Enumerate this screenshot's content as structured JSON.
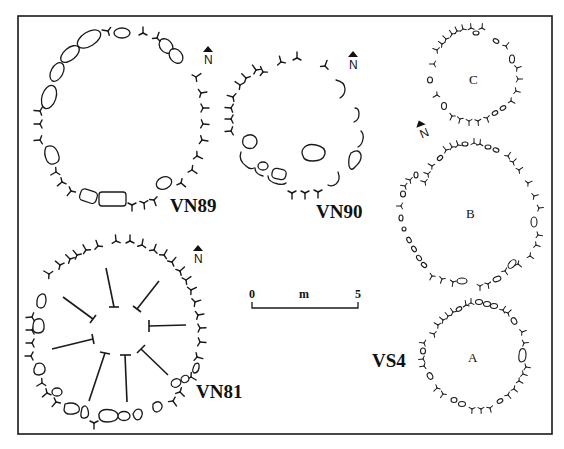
{
  "figure": {
    "type": "archaeological site plan",
    "frame": {
      "x": 18,
      "y": 16,
      "width": 534,
      "height": 418
    }
  },
  "sites": [
    {
      "id": "vn89",
      "label": "VN89",
      "center": [
        120,
        120
      ],
      "radius": 82,
      "label_pos": [
        170,
        212
      ]
    },
    {
      "id": "vn90",
      "label": "VN90",
      "center": [
        298,
        130
      ],
      "radius": 64,
      "label_pos": [
        316,
        218
      ]
    },
    {
      "id": "vn81",
      "label": "VN81",
      "center": [
        120,
        330
      ],
      "radius": 95,
      "label_pos": [
        196,
        398
      ]
    },
    {
      "id": "vs4",
      "label": "VS4",
      "label_pos": [
        372,
        367
      ]
    }
  ],
  "rings": [
    {
      "id": "ring-c",
      "letter": "C",
      "center": [
        473,
        70
      ],
      "radius": 43
    },
    {
      "id": "ring-b",
      "letter": "B",
      "center": [
        472,
        215
      ],
      "radius": 73
    },
    {
      "id": "ring-a",
      "letter": "A",
      "center": [
        472,
        360
      ],
      "radius": 50
    }
  ],
  "north_arrows": [
    {
      "id": "north-vn89",
      "letter": "N",
      "pos": [
        208,
        52
      ],
      "rotation": 0
    },
    {
      "id": "north-vn90",
      "letter": "N",
      "pos": [
        353,
        58
      ],
      "rotation": 0
    },
    {
      "id": "north-vs4",
      "letter": "N",
      "pos": [
        417,
        132
      ],
      "rotation": -20
    },
    {
      "id": "north-vn81",
      "letter": "N",
      "pos": [
        197,
        258
      ],
      "rotation": 0
    }
  ],
  "scale_bar": {
    "start_label": "0",
    "unit_label": "m",
    "end_label": "5",
    "length_m": 5,
    "x1": 251,
    "x2": 358,
    "y": 307
  }
}
